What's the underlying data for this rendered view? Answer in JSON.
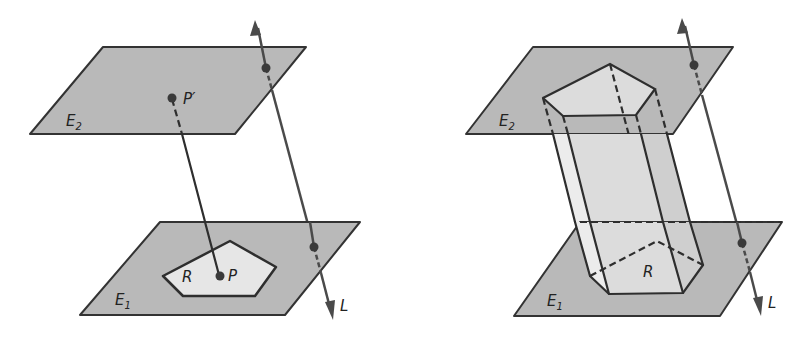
{
  "figures": [
    {
      "id": "left",
      "description": "Region R in plane E1 projected along line L onto parallel plane E2; point P maps to P'",
      "labels": {
        "upper_plane": "E",
        "upper_plane_sub": "2",
        "lower_plane": "E",
        "lower_plane_sub": "1",
        "region": "R",
        "point": "P",
        "point_image": "P′",
        "line": "L"
      }
    },
    {
      "id": "right",
      "description": "Prism formed by projecting pentagonal region R in E1 along L to parallel plane E2",
      "labels": {
        "upper_plane": "E",
        "upper_plane_sub": "2",
        "lower_plane": "E",
        "lower_plane_sub": "1",
        "region": "R",
        "line": "L"
      }
    }
  ],
  "colors": {
    "plane_fill": "#b9b9b9",
    "region_fill": "#e6e6e6",
    "stroke": "#2e2e2e",
    "background": "#ffffff"
  }
}
